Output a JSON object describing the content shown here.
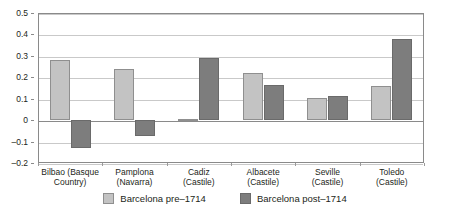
{
  "chart_data": {
    "type": "bar",
    "title": "",
    "subtitle": "",
    "xlabel": "",
    "ylabel": "",
    "ylim": [
      -0.2,
      0.5
    ],
    "yticks": [
      0.5,
      0.4,
      0.3,
      0.2,
      0.1,
      0,
      -0.1,
      -0.2
    ],
    "ytick_labels": [
      "0.5",
      "0.4",
      "0.3",
      "0.2",
      "0.1",
      "0",
      "–0.1",
      "–0.2"
    ],
    "grid": "horizontal",
    "legend_position": "bottom-center",
    "categories": [
      "Bilbao (Basque Country)",
      "Pamplona (Navarra)",
      "Cadiz (Castile)",
      "Albacete (Castile)",
      "Seville (Castile)",
      "Toledo (Castile)"
    ],
    "category_lines": [
      [
        "Bilbao (Basque",
        "Country)"
      ],
      [
        "Pamplona",
        "(Navarra)"
      ],
      [
        "Cadiz",
        "(Castile)"
      ],
      [
        "Albacete",
        "(Castile)"
      ],
      [
        "Seville",
        "(Castile)"
      ],
      [
        "Toledo",
        "(Castile)"
      ]
    ],
    "series": [
      {
        "name": "Barcelona pre–1714",
        "color": "#c3c3c3",
        "values": [
          0.28,
          0.24,
          0.005,
          0.22,
          0.105,
          0.16
        ]
      },
      {
        "name": "Barcelona post–1714",
        "color": "#7d7d7d",
        "values": [
          -0.13,
          -0.075,
          0.29,
          0.165,
          0.115,
          0.38
        ]
      }
    ]
  },
  "legend": {
    "items": [
      {
        "label": "Barcelona pre–1714",
        "swatch": "pre"
      },
      {
        "label": "Barcelona post–1714",
        "swatch": "post"
      }
    ]
  },
  "bottom_caption": ""
}
